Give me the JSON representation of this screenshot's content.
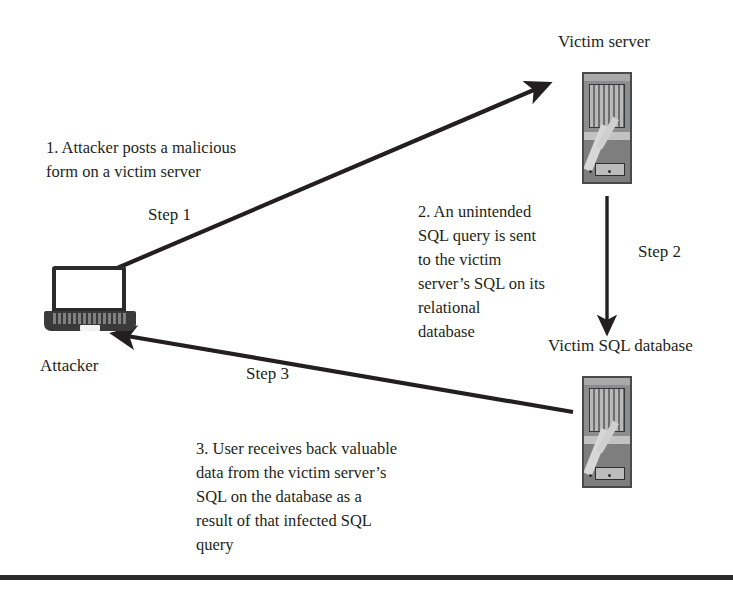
{
  "diagram": {
    "accent_color": "#231f20",
    "icon_gray": "#8d8d8d"
  },
  "nodes": {
    "attacker": {
      "label": "Attacker",
      "icon": "laptop-icon"
    },
    "victim_server": {
      "label": "Victim server",
      "icon": "server-tower-icon"
    },
    "victim_database": {
      "label": "Victim SQL database",
      "icon": "server-tower-icon"
    }
  },
  "arrows": {
    "step1": {
      "label": "Step 1",
      "direction": "attacker-to-victim-server"
    },
    "step2": {
      "label": "Step 2",
      "direction": "victim-server-to-database"
    },
    "step3": {
      "label": "Step 3",
      "direction": "database-to-attacker"
    }
  },
  "descriptions": {
    "step1": "1.  Attacker posts a malicious\n    form on a victim server",
    "step2": "2. An unintended\nSQL query is sent\nto the victim\nserver’s SQL on its\nrelational\ndatabase",
    "step3": "3. User receives back valuable\ndata from the victim server’s\nSQL on the database as a\nresult of that infected SQL\nquery"
  }
}
